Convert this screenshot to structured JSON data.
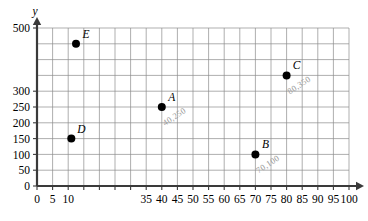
{
  "chart_data": {
    "type": "scatter",
    "title": "",
    "xlabel": "",
    "ylabel": "y",
    "xlim": [
      0,
      100
    ],
    "ylim": [
      0,
      500
    ],
    "grid": true,
    "legend": "none",
    "x_tick_step": 5,
    "y_tick_step": 50,
    "x_tick_labels": [
      "0",
      "5",
      "10",
      "",
      "",
      "",
      "",
      "35",
      "40",
      "45",
      "50",
      "55",
      "60",
      "65",
      "70",
      "75",
      "80",
      "85",
      "90",
      "95",
      "100"
    ],
    "x_tick_values": [
      0,
      5,
      10,
      15,
      20,
      25,
      30,
      35,
      40,
      45,
      50,
      55,
      60,
      65,
      70,
      75,
      80,
      85,
      90,
      95,
      100
    ],
    "y_tick_labels": [
      "0",
      "50",
      "100",
      "150",
      "200",
      "250",
      "300",
      "",
      "",
      "",
      "500"
    ],
    "y_tick_values": [
      0,
      50,
      100,
      150,
      200,
      250,
      300,
      350,
      400,
      450,
      500
    ],
    "points": [
      {
        "label": "A",
        "x": 40,
        "y": 250,
        "annotation": "40,250"
      },
      {
        "label": "B",
        "x": 70,
        "y": 100,
        "annotation": "70,100"
      },
      {
        "label": "C",
        "x": 80,
        "y": 350,
        "annotation": "80,350"
      },
      {
        "label": "D",
        "x": 11,
        "y": 150,
        "annotation": ""
      },
      {
        "label": "E",
        "x": 12.5,
        "y": 450,
        "annotation": ""
      }
    ],
    "colors": {
      "point": "#000000",
      "grid": "#8c8c8c",
      "axis": "#3a3a3a",
      "annotation": "#9a9a9a"
    }
  }
}
